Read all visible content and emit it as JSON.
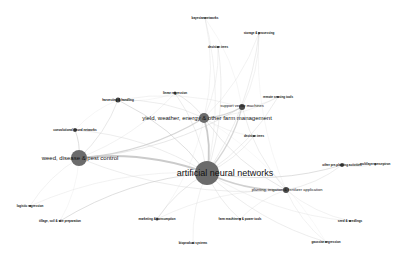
{
  "graph": {
    "title": "keyword co-occurrence network",
    "nodes": [
      {
        "id": "ann",
        "label": "artificial neural networks",
        "x": 207,
        "y": 173,
        "r": 12,
        "size": "xl",
        "lx": 225,
        "ly": 173
      },
      {
        "id": "weed",
        "label": "weed, disease & pest control",
        "x": 79,
        "y": 158,
        "r": 8,
        "size": "l",
        "lx": 80,
        "ly": 158
      },
      {
        "id": "yield",
        "label": "yield, weather, energy & other farm management",
        "x": 204,
        "y": 118,
        "r": 5,
        "size": "l",
        "lx": 207,
        "ly": 118
      },
      {
        "id": "svm",
        "label": "support vector machines",
        "x": 242,
        "y": 107,
        "r": 3,
        "size": "m",
        "lx": 242,
        "ly": 106
      },
      {
        "id": "planting",
        "label": "planting, irrigation & fertilizer application",
        "x": 286,
        "y": 190,
        "r": 3,
        "size": "m",
        "lx": 287,
        "ly": 190
      },
      {
        "id": "harvest",
        "label": "harvesting & handling",
        "x": 118,
        "y": 100,
        "r": 2.5,
        "size": "s",
        "lx": 118,
        "ly": 100
      },
      {
        "id": "linreg",
        "label": "linear regression",
        "x": 175,
        "y": 93,
        "r": 1.5,
        "size": "s",
        "lx": 175,
        "ly": 93
      },
      {
        "id": "cnn",
        "label": "convolutional neural networks",
        "x": 75,
        "y": 130,
        "r": 2,
        "size": "s",
        "lx": 75,
        "ly": 130
      },
      {
        "id": "preplant",
        "label": "other pre-planting activities",
        "x": 342,
        "y": 165,
        "r": 2,
        "size": "s",
        "lx": 342,
        "ly": 165
      },
      {
        "id": "multilayer",
        "label": "multilayer perceptron",
        "x": 375,
        "y": 164,
        "r": 1,
        "size": "s",
        "lx": 375,
        "ly": 164
      },
      {
        "id": "tsr",
        "label": "remote sensing tools",
        "x": 278,
        "y": 97,
        "r": 1,
        "size": "s",
        "lx": 278,
        "ly": 97
      },
      {
        "id": "decision",
        "label": "decision trees",
        "x": 254,
        "y": 136,
        "r": 1,
        "size": "s",
        "lx": 254,
        "ly": 136
      },
      {
        "id": "storage",
        "label": "storage & processing",
        "x": 259,
        "y": 33,
        "r": 1,
        "size": "s",
        "lx": 259,
        "ly": 33
      },
      {
        "id": "dectree",
        "label": "decision trees",
        "x": 218,
        "y": 47,
        "r": 1,
        "size": "s",
        "lx": 218,
        "ly": 47
      },
      {
        "id": "bayesian",
        "label": "bayesian networks",
        "x": 205,
        "y": 18,
        "r": 1,
        "size": "s",
        "lx": 205,
        "ly": 18
      },
      {
        "id": "logreg",
        "label": "logistic regression",
        "x": 30,
        "y": 206,
        "r": 1,
        "size": "s",
        "lx": 30,
        "ly": 206
      },
      {
        "id": "tillage",
        "label": "tillage, soil & site preparation",
        "x": 60,
        "y": 221,
        "r": 1,
        "size": "s",
        "lx": 60,
        "ly": 221
      },
      {
        "id": "marketing",
        "label": "marketing & consumption",
        "x": 157,
        "y": 219,
        "r": 1.5,
        "size": "s",
        "lx": 157,
        "ly": 219
      },
      {
        "id": "farmmach",
        "label": "farm machinery & power tools",
        "x": 240,
        "y": 219,
        "r": 1,
        "size": "s",
        "lx": 240,
        "ly": 219
      },
      {
        "id": "seed",
        "label": "seed & seedlings",
        "x": 350,
        "y": 221,
        "r": 1,
        "size": "s",
        "lx": 350,
        "ly": 221
      },
      {
        "id": "gpr",
        "label": "gaussian regression",
        "x": 326,
        "y": 242,
        "r": 1,
        "size": "s",
        "lx": 326,
        "ly": 242
      },
      {
        "id": "bio",
        "label": "bioproduct systems",
        "x": 193,
        "y": 243,
        "r": 1,
        "size": "s",
        "lx": 193,
        "ly": 243
      }
    ],
    "edges": [
      [
        "ann",
        "weed",
        3
      ],
      [
        "ann",
        "yield",
        3
      ],
      [
        "ann",
        "svm",
        2
      ],
      [
        "ann",
        "planting",
        2.5
      ],
      [
        "ann",
        "harvest",
        1.5
      ],
      [
        "ann",
        "linreg",
        1
      ],
      [
        "ann",
        "cnn",
        1
      ],
      [
        "ann",
        "preplant",
        1.5
      ],
      [
        "ann",
        "tillage",
        1.5
      ],
      [
        "ann",
        "marketing",
        1.2
      ],
      [
        "ann",
        "farmmach",
        1
      ],
      [
        "ann",
        "gpr",
        1
      ],
      [
        "ann",
        "decision",
        1
      ],
      [
        "ann",
        "tsr",
        1
      ],
      [
        "ann",
        "storage",
        1
      ],
      [
        "ann",
        "dectree",
        1
      ],
      [
        "ann",
        "bayesian",
        0.8
      ],
      [
        "ann",
        "logreg",
        0.8
      ],
      [
        "ann",
        "seed",
        0.8
      ],
      [
        "ann",
        "bio",
        0.8
      ],
      [
        "weed",
        "yield",
        2
      ],
      [
        "weed",
        "cnn",
        1.5
      ],
      [
        "weed",
        "harvest",
        1.2
      ],
      [
        "weed",
        "svm",
        1.2
      ],
      [
        "weed",
        "planting",
        1
      ],
      [
        "weed",
        "logreg",
        0.8
      ],
      [
        "weed",
        "linreg",
        0.8
      ],
      [
        "yield",
        "svm",
        2
      ],
      [
        "yield",
        "harvest",
        1
      ],
      [
        "yield",
        "linreg",
        1.2
      ],
      [
        "yield",
        "planting",
        1.2
      ],
      [
        "yield",
        "decision",
        0.8
      ],
      [
        "yield",
        "dectree",
        0.8
      ],
      [
        "yield",
        "bayesian",
        0.8
      ],
      [
        "yield",
        "storage",
        0.8
      ],
      [
        "yield",
        "tsr",
        0.8
      ],
      [
        "svm",
        "planting",
        1
      ],
      [
        "svm",
        "storage",
        0.8
      ],
      [
        "svm",
        "tsr",
        0.8
      ],
      [
        "svm",
        "harvest",
        0.8
      ],
      [
        "svm",
        "bayesian",
        0.6
      ],
      [
        "planting",
        "preplant",
        1
      ],
      [
        "planting",
        "seed",
        0.8
      ],
      [
        "planting",
        "gpr",
        0.8
      ],
      [
        "planting",
        "farmmach",
        0.8
      ],
      [
        "planting",
        "marketing",
        0.8
      ],
      [
        "preplant",
        "multilayer",
        0.8
      ],
      [
        "harvest",
        "cnn",
        0.6
      ],
      [
        "harvest",
        "linreg",
        0.6
      ],
      [
        "storage",
        "planting",
        0.6
      ],
      [
        "tillage",
        "weed",
        0.6
      ],
      [
        "marketing",
        "yield",
        0.6
      ],
      [
        "gpr",
        "yield",
        0.5
      ]
    ],
    "colors": {
      "node_fill_large": "#6b6b6b",
      "node_fill_small": "#4a4a4a",
      "edge": "#c8c8c8",
      "label": "#111111",
      "background": "#ffffff"
    }
  }
}
